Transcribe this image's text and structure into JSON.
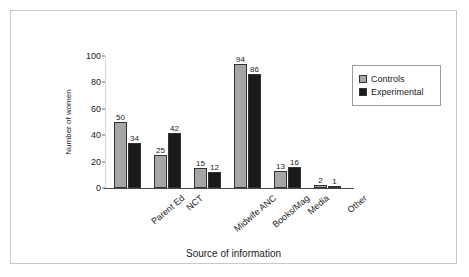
{
  "chart_data": {
    "type": "bar",
    "title": "",
    "xlabel": "Source of information",
    "ylabel": "Number of women",
    "ylim": [
      0,
      100
    ],
    "yticks": [
      0,
      20,
      40,
      60,
      80,
      100
    ],
    "grid": false,
    "legend_position": "top-right",
    "categories": [
      "Parent Ed",
      "NCT",
      "Midwife ANC",
      "Books/Mag",
      "Media",
      "Other"
    ],
    "series": [
      {
        "name": "Controls",
        "color": "#a6a6a6",
        "values": [
          50,
          25,
          15,
          94,
          13,
          2
        ]
      },
      {
        "name": "Experimental",
        "color": "#1a1a1a",
        "values": [
          34,
          42,
          12,
          86,
          16,
          1
        ]
      }
    ]
  },
  "axis": {
    "y_title": "Number of women",
    "x_title": "Source of information"
  }
}
